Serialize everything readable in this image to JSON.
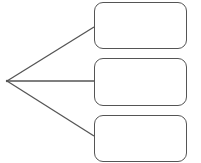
{
  "diagram": {
    "type": "tree-branch",
    "stroke_color": "#555555",
    "background": "#ffffff",
    "root": {
      "x": 7,
      "y": 81
    },
    "boxes": [
      {
        "label": "",
        "x": 94,
        "y": 2,
        "w": 93,
        "h": 47,
        "anchor_y": 27
      },
      {
        "label": "",
        "x": 94,
        "y": 58,
        "w": 93,
        "h": 48,
        "anchor_y": 81
      },
      {
        "label": "",
        "x": 94,
        "y": 115,
        "w": 93,
        "h": 47,
        "anchor_y": 136
      }
    ]
  }
}
